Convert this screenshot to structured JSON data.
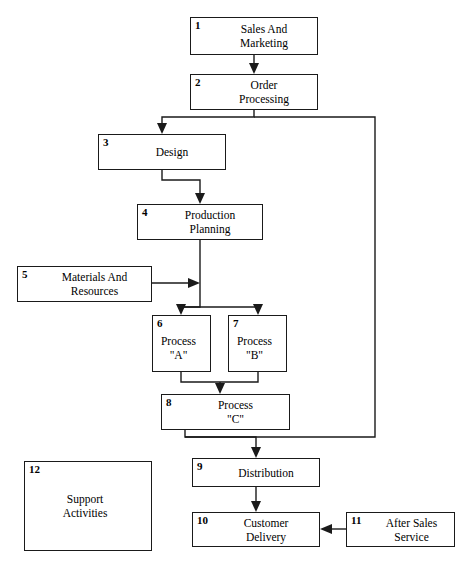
{
  "diagram": {
    "type": "flowchart",
    "background_color": "#ffffff",
    "line_color": "#1a1a1a",
    "nodes": [
      {
        "num": "1",
        "label": "Sales And\nMarketing",
        "x": 190,
        "y": 17,
        "w": 128,
        "h": 38
      },
      {
        "num": "2",
        "label": "Order\nProcessing",
        "x": 190,
        "y": 74,
        "w": 128,
        "h": 36
      },
      {
        "num": "3",
        "label": "Design",
        "x": 98,
        "y": 134,
        "w": 128,
        "h": 36
      },
      {
        "num": "4",
        "label": "Production\nPlanning",
        "x": 137,
        "y": 204,
        "w": 126,
        "h": 36
      },
      {
        "num": "5",
        "label": "Materials And\nResources",
        "x": 17,
        "y": 266,
        "w": 135,
        "h": 36
      },
      {
        "num": "6",
        "label": "Process\n\"A\"",
        "x": 152,
        "y": 315,
        "w": 59,
        "h": 57
      },
      {
        "num": "7",
        "label": "Process\n\"B\"",
        "x": 228,
        "y": 315,
        "w": 59,
        "h": 57
      },
      {
        "num": "8",
        "label": "Process\n\"C\"",
        "x": 161,
        "y": 394,
        "w": 129,
        "h": 36
      },
      {
        "num": "9",
        "label": "Distribution",
        "x": 192,
        "y": 458,
        "w": 128,
        "h": 29
      },
      {
        "num": "10",
        "label": "Customer\nDelivery",
        "x": 192,
        "y": 512,
        "w": 128,
        "h": 35
      },
      {
        "num": "11",
        "label": "After Sales\nService",
        "x": 346,
        "y": 512,
        "w": 109,
        "h": 35
      },
      {
        "num": "12",
        "label": "Support\nActivities",
        "x": 24,
        "y": 461,
        "w": 128,
        "h": 90
      }
    ],
    "connections": [
      {
        "from": "1",
        "to": "2",
        "kind": "arrow-down"
      },
      {
        "from": "2",
        "to": "3",
        "kind": "arrow-down"
      },
      {
        "from": "3",
        "to": "4",
        "kind": "arrow-down"
      },
      {
        "from": "4",
        "to": "6",
        "kind": "arrow-down-split"
      },
      {
        "from": "4",
        "to": "7",
        "kind": "arrow-down-split"
      },
      {
        "from": "5",
        "to": "4",
        "kind": "arrow-right"
      },
      {
        "from": "6",
        "to": "8",
        "kind": "arrow-down-merge"
      },
      {
        "from": "7",
        "to": "8",
        "kind": "arrow-down-merge"
      },
      {
        "from": "8",
        "to": "9",
        "kind": "arrow-down"
      },
      {
        "from": "9",
        "to": "10",
        "kind": "arrow-down"
      },
      {
        "from": "11",
        "to": "10",
        "kind": "arrow-left"
      },
      {
        "from": "2",
        "to": "8",
        "kind": "feedback-right-loop"
      }
    ]
  }
}
